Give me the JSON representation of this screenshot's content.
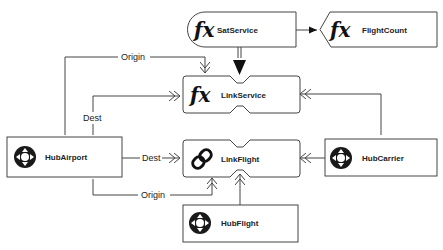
{
  "diagram": {
    "nodes": {
      "sat_service": {
        "label": "SatService",
        "icon": "function-icon",
        "icon_text": "fx"
      },
      "flight_count": {
        "label": "FlightCount",
        "icon": "function-icon",
        "icon_text": "fx"
      },
      "link_service": {
        "label": "LinkService",
        "icon": "function-icon",
        "icon_text": "fx"
      },
      "link_flight": {
        "label": "LinkFlight",
        "icon": "chain-link-icon"
      },
      "hub_airport": {
        "label": "HubAirport",
        "icon": "hub-icon"
      },
      "hub_carrier": {
        "label": "HubCarrier",
        "icon": "hub-icon"
      },
      "hub_flight": {
        "label": "HubFlight",
        "icon": "hub-icon"
      }
    },
    "edges": {
      "airport_service_origin": {
        "label": "Origin"
      },
      "airport_service_dest": {
        "label": "Dest"
      },
      "airport_flight_dest": {
        "label": "Dest"
      },
      "airport_flight_origin": {
        "label": "Origin"
      }
    }
  }
}
